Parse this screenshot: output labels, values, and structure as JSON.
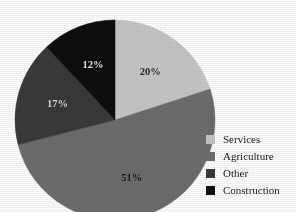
{
  "chart_data": {
    "type": "pie",
    "title": "",
    "categories": [
      "Services",
      "Agriculture",
      "Other",
      "Construction"
    ],
    "values": [
      20,
      51,
      17,
      12
    ],
    "value_labels": [
      "20%",
      "51%",
      "17%",
      "12%"
    ],
    "colors": [
      "#c8c8c8",
      "#6e6e6e",
      "#3a3a3a",
      "#0d0d0d"
    ],
    "label_colors": [
      "#2a2a2a",
      "#1a1a1a",
      "#d8d8d8",
      "#e8e8e8"
    ],
    "units": "percent",
    "start_angle_deg": 0,
    "direction": "clockwise",
    "legend_position": "right",
    "grid": false,
    "background": "#ffffff"
  },
  "legend": {
    "items": [
      {
        "label": "Services",
        "color": "#c8c8c8"
      },
      {
        "label": "Agriculture",
        "color": "#6e6e6e"
      },
      {
        "label": "Other",
        "color": "#3a3a3a"
      },
      {
        "label": "Construction",
        "color": "#0d0d0d"
      }
    ]
  },
  "geometry": {
    "cx": 115,
    "cy": 120,
    "r": 100
  }
}
